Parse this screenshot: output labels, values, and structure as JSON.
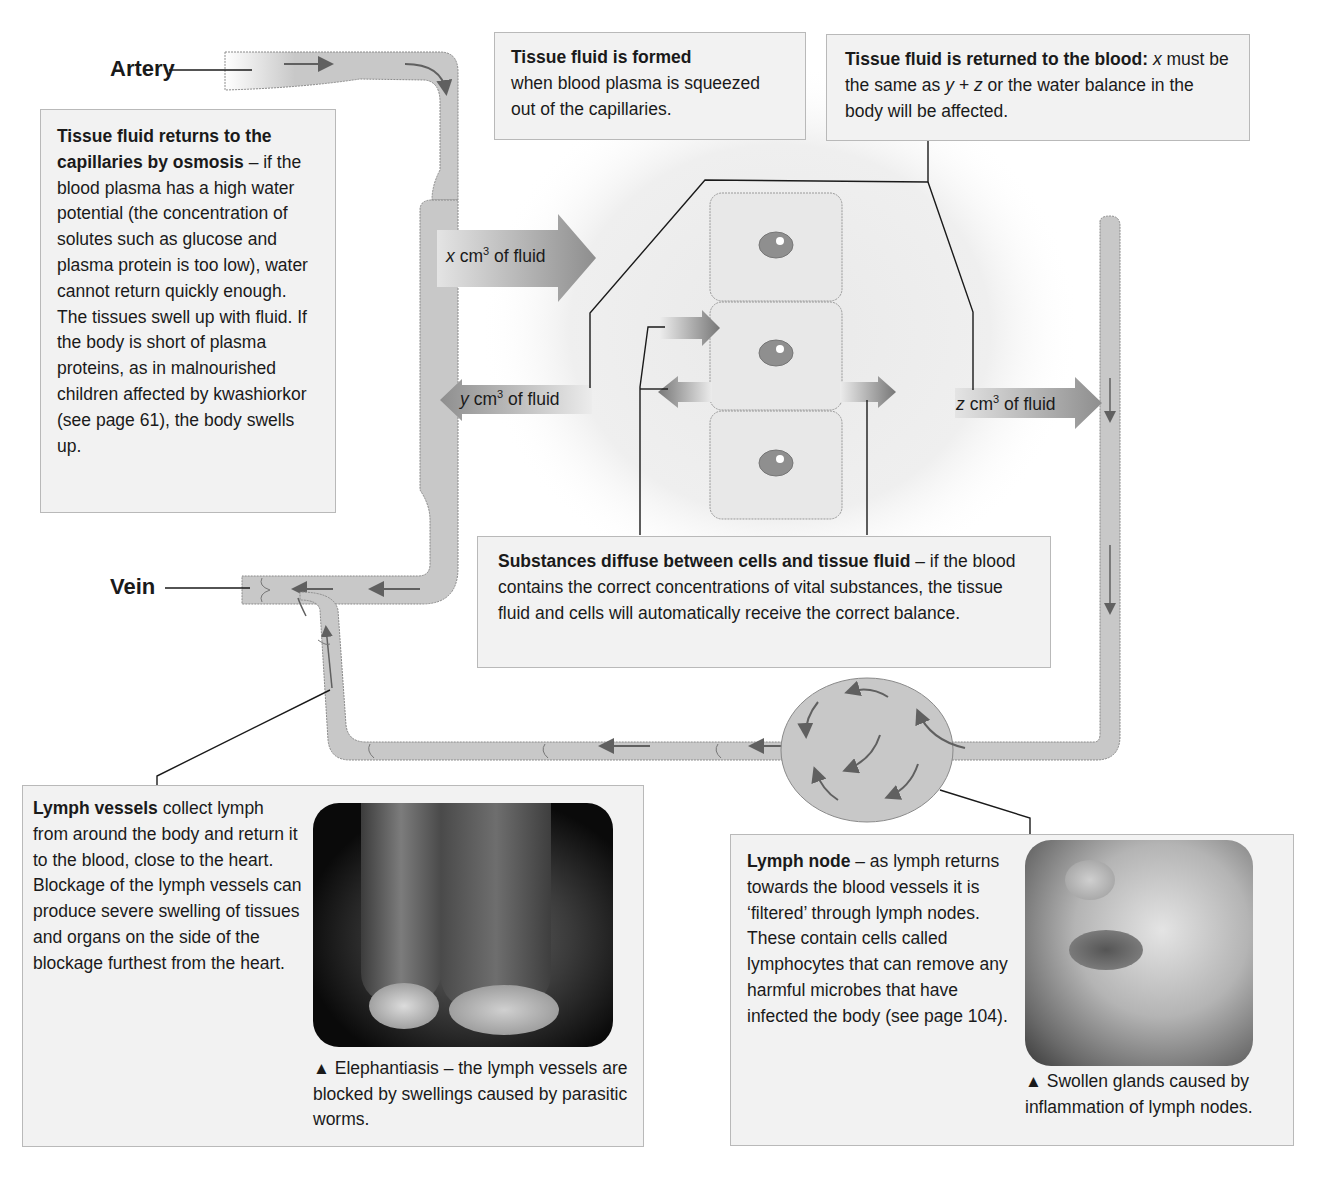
{
  "labels": {
    "artery": "Artery",
    "vein": "Vein"
  },
  "flows": {
    "x": {
      "var": "x",
      "unit": "cm",
      "exp": "3",
      "rest": " of fluid"
    },
    "y": {
      "var": "y",
      "unit": "cm",
      "exp": "3",
      "rest": " of fluid"
    },
    "z": {
      "var": "z",
      "unit": "cm",
      "exp": "3",
      "rest": " of fluid"
    }
  },
  "boxes": {
    "osmosis": {
      "title": "Tissue fluid returns to the capillaries by osmosis",
      "body": " – if the blood plasma has a high water potential (the concentration of solutes such as glucose and plasma protein is too low), water cannot return quickly enough. The tissues swell up with fluid. If the body is short of plasma proteins, as in malnourished children affected by kwashiorkor (see page 61), the body swells up."
    },
    "formed": {
      "title": "Tissue fluid is formed",
      "body": "when blood plasma is squeezed out of the capillaries."
    },
    "returned": {
      "title": "Tissue fluid is returned to the blood:",
      "body_1": " x",
      "body_2": " must be the same as ",
      "body_3": "y + z",
      "body_4": " or the water balance in the body will be affected."
    },
    "diffuse": {
      "title": "Substances diffuse between cells and tissue fluid",
      "body": " – if the blood contains the correct concentrations of vital substances, the tissue fluid and cells will automatically receive the correct balance."
    },
    "lymph_vessels": {
      "title": "Lymph vessels",
      "body": " collect lymph from around the body and return it to the blood, close to the heart. Blockage of the lymph vessels can produce severe swelling of tissues and organs on the side of the blockage furthest from the heart.",
      "photo_caption": "Elephantiasis – the lymph vessels are blocked by swellings caused by parasitic worms."
    },
    "lymph_node": {
      "title": "Lymph node",
      "body": " – as lymph returns towards the blood vessels it is ‘filtered’ through lymph nodes. These contain cells called lymphocytes that can remove any harmful microbes that have infected the body (see page 104).",
      "photo_caption": "Swollen glands caused by inflammation of lymph nodes."
    }
  },
  "caption_marker": "▲",
  "colors": {
    "vessel_fill": "#c8c8c8",
    "vessel_stroke": "#8a8a8a",
    "arrow": "#606060",
    "box_bg": "#f2f2f2",
    "nucleus": "#8f8f8f"
  }
}
